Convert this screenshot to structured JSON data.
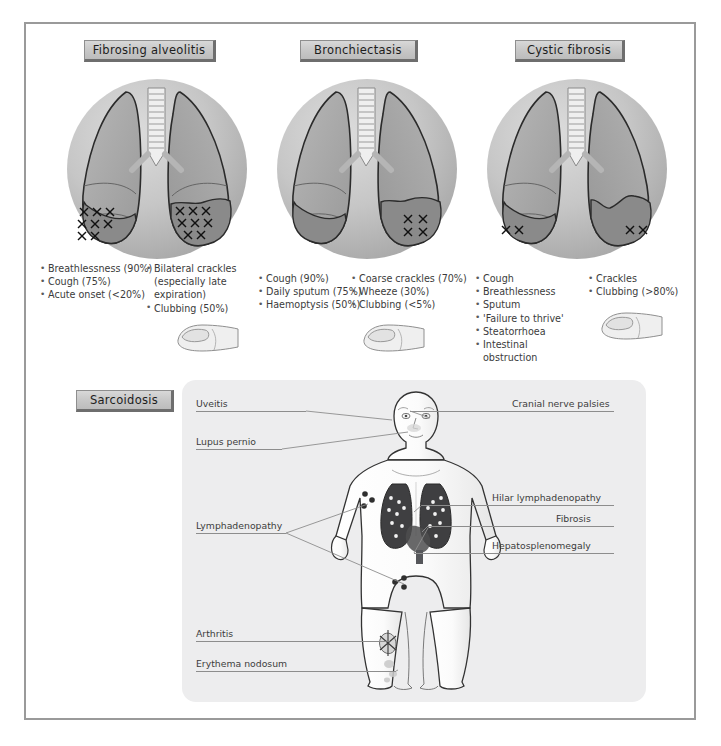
{
  "figure": {
    "panels": [
      {
        "id": "fibrosing-alveolitis",
        "title": "Fibrosing alveolitis",
        "symptoms_left": [
          "Breathlessness (90%)",
          "Cough (75%)",
          "Acute onset (<20%)"
        ],
        "symptoms_right": [
          "Bilateral crackles",
          "(especially late",
          "expiration)",
          "Clubbing (50%)"
        ],
        "right_continuation_lines": [
          1,
          2
        ],
        "lung_crosses": "bilateral basal, dense"
      },
      {
        "id": "bronchiectasis",
        "title": "Bronchiectasis",
        "symptoms_left": [
          "Cough (90%)",
          "Daily sputum (75%)",
          "Haemoptysis (50%)"
        ],
        "symptoms_right": [
          "Coarse crackles (70%)",
          "Wheeze (30%)",
          "Clubbing (<5%)"
        ],
        "right_continuation_lines": [],
        "lung_crosses": "right base only"
      },
      {
        "id": "cystic-fibrosis",
        "title": "Cystic fibrosis",
        "symptoms_left": [
          "Cough",
          "Breathlessness",
          "Sputum",
          "'Failure to thrive'",
          "Steatorrhoea",
          "Intestinal",
          "obstruction"
        ],
        "symptoms_right": [
          "Crackles",
          "Clubbing (>80%)"
        ],
        "right_continuation_lines": [],
        "left_continuation_lines": [
          6
        ],
        "lung_crosses": "both bases, sparse"
      }
    ],
    "sarcoidosis": {
      "title": "Sarcoidosis",
      "labels_left": [
        {
          "text": "Uveitis",
          "target": "eye"
        },
        {
          "text": "Lupus pernio",
          "target": "nose-cheek"
        },
        {
          "text": "Lymphadenopathy",
          "target": "axillary-inguinal-nodes"
        },
        {
          "text": "Arthritis",
          "target": "knee"
        },
        {
          "text": "Erythema nodosum",
          "target": "shin"
        }
      ],
      "labels_right": [
        {
          "text": "Cranial nerve palsies",
          "target": "head"
        },
        {
          "text": "Hilar lymphadenopathy",
          "target": "lung-hila"
        },
        {
          "text": "Fibrosis",
          "target": "lung-fields"
        },
        {
          "text": "Hepatosplenomegaly",
          "target": "liver-spleen"
        }
      ]
    }
  },
  "colors": {
    "frame_border": "#9a9a9a",
    "plaque_face": "#cdcdcd",
    "plaque_shadow": "#6e6e6e",
    "panel_background": "#ededee",
    "text": "#3b3b3b",
    "lung_fill": "#a9a9a9",
    "lung_shaded_lobe": "#8c8c8c",
    "thorax_fill": "#c2c2c2",
    "sarcoid_lung": "#4a4a4a",
    "leader_line": "#8d8d8d"
  }
}
